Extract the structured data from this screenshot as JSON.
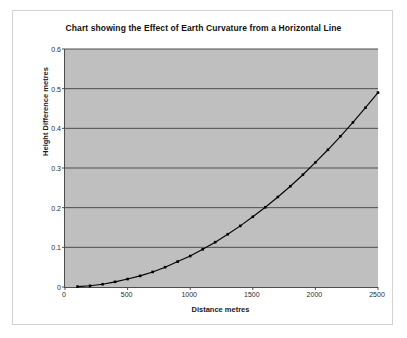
{
  "chart_data": {
    "type": "line",
    "title": "Chart showing the Effect of Earth Curvature from a Horizontal Line",
    "xlabel": "Distance  metres",
    "ylabel": "Height Difference metres",
    "xlim": [
      0,
      2500
    ],
    "ylim": [
      0,
      0.6
    ],
    "xticks": [
      0,
      500,
      1000,
      1500,
      2000,
      2500
    ],
    "xtick_labels": [
      "0",
      "500",
      "1000",
      "1500",
      "2000",
      "2500"
    ],
    "yticks": [
      0,
      0.1,
      0.2,
      0.3,
      0.4,
      0.5,
      0.6
    ],
    "ytick_labels": [
      "0",
      "0.1",
      "0.2",
      "0.3",
      "0.4",
      "0.5",
      "0.6"
    ],
    "grid": "horizontal",
    "legend": "none",
    "markers": "square",
    "series": [
      {
        "name": "Height Difference metres",
        "x": [
          100,
          200,
          300,
          400,
          500,
          600,
          700,
          800,
          900,
          1000,
          1100,
          1200,
          1300,
          1400,
          1500,
          1600,
          1700,
          1800,
          1900,
          2000,
          2100,
          2200,
          2300,
          2400,
          2500
        ],
        "values": [
          0.001,
          0.003,
          0.007,
          0.013,
          0.02,
          0.028,
          0.038,
          0.05,
          0.064,
          0.078,
          0.095,
          0.113,
          0.133,
          0.154,
          0.177,
          0.201,
          0.227,
          0.254,
          0.283,
          0.314,
          0.346,
          0.38,
          0.415,
          0.452,
          0.49
        ]
      }
    ],
    "colors": {
      "plot_background": "#bfbfbf",
      "gridline": "#4d4d4d",
      "axis": "#4d4d4d",
      "series_line": "#000000",
      "marker": "#000000",
      "panel_background": "#ffffff",
      "panel_border": "#d2d2d2",
      "text": "#1a1a1a"
    }
  }
}
